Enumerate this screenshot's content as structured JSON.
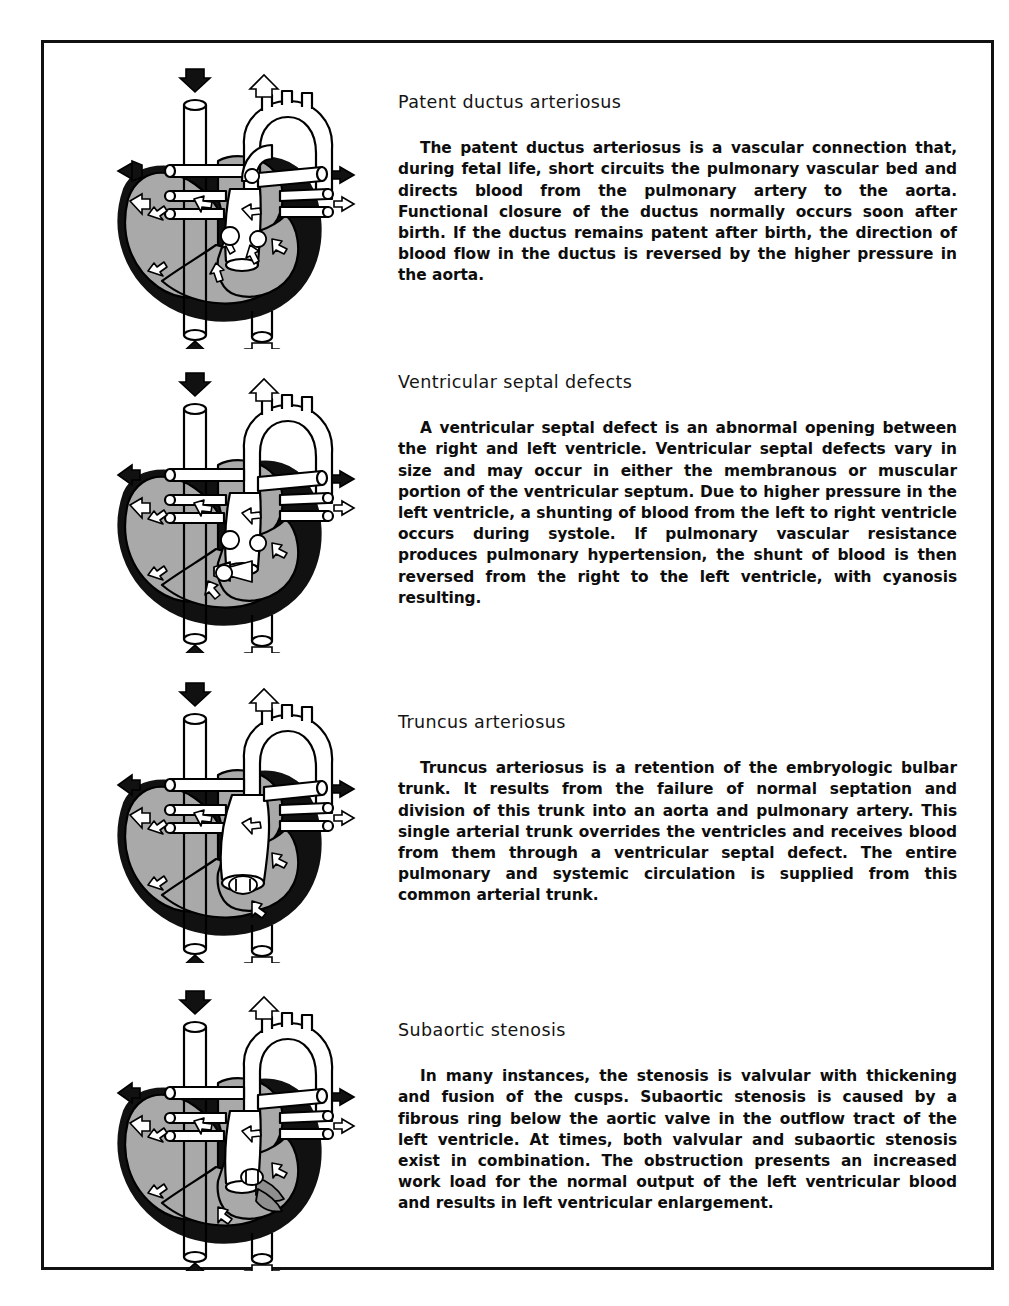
{
  "page": {
    "border_color": "#111111",
    "background": "#ffffff"
  },
  "palette": {
    "outline": "#000000",
    "myocardium_black": "#111111",
    "chamber_gray": "#a9a9a9",
    "vessel_white": "#ffffff",
    "arrow_filled": "#111111",
    "arrow_outline_fill": "#ffffff",
    "stenosis_gray": "#8f8f8f"
  },
  "sections": [
    {
      "id": "patent-ductus-arteriosus",
      "heading": "Patent ductus arteriosus",
      "body": "The patent ductus arteriosus is a vascular connection that, during fetal life, short circuits the pulmonary vascular bed and directs blood from the pulmonary artery to the aorta. Functional closure of the ductus normally occurs soon after birth. If the ductus remains patent after birth, the direction of blood flow in the ductus is reversed by the higher pressure in the aorta.",
      "figure": {
        "name": "heart-diagram-patent-ductus-arteriosus",
        "variant": "pda",
        "flow_arrows": [
          {
            "name": "superior-vena-cava-inflow-arrow",
            "style": "filled",
            "direction": "down"
          },
          {
            "name": "aortic-arch-outflow-arrow",
            "style": "outline",
            "direction": "up"
          },
          {
            "name": "left-systemic-artery-arrow",
            "style": "filled",
            "direction": "left"
          },
          {
            "name": "left-pulmonary-vein-arrow",
            "style": "outline",
            "direction": "left"
          },
          {
            "name": "right-pulmonary-artery-arrow",
            "style": "filled",
            "direction": "right"
          },
          {
            "name": "right-pulmonary-vein-arrow",
            "style": "outline",
            "direction": "right"
          },
          {
            "name": "inferior-vena-cava-inflow-arrow",
            "style": "filled",
            "direction": "up"
          },
          {
            "name": "descending-aorta-outflow-arrow",
            "style": "outline",
            "direction": "down"
          }
        ]
      }
    },
    {
      "id": "ventricular-septal-defects",
      "heading": "Ventricular septal defects",
      "body": "A ventricular septal defect is an abnormal opening between the right and left ventricle. Ventricular septal defects vary in size and may occur in either the membranous or muscular portion of the ventricular septum. Due to higher pressure in the left ventricle, a shunting of blood from the left to right ventricle occurs during systole. If pulmonary vascular resistance produces pulmonary hypertension, the shunt of blood is then reversed from the right to the left ventricle, with cyanosis resulting.",
      "figure": {
        "name": "heart-diagram-ventricular-septal-defect",
        "variant": "vsd",
        "flow_arrows": [
          {
            "name": "superior-vena-cava-inflow-arrow",
            "style": "filled",
            "direction": "down"
          },
          {
            "name": "aortic-arch-outflow-arrow",
            "style": "outline",
            "direction": "up"
          },
          {
            "name": "left-systemic-artery-arrow",
            "style": "filled",
            "direction": "left"
          },
          {
            "name": "left-pulmonary-vein-arrow",
            "style": "outline",
            "direction": "left"
          },
          {
            "name": "right-pulmonary-artery-arrow",
            "style": "filled",
            "direction": "right"
          },
          {
            "name": "right-pulmonary-vein-arrow",
            "style": "outline",
            "direction": "right"
          },
          {
            "name": "inferior-vena-cava-inflow-arrow",
            "style": "filled",
            "direction": "up"
          },
          {
            "name": "descending-aorta-outflow-arrow",
            "style": "outline",
            "direction": "down"
          },
          {
            "name": "septal-shunt-arrow",
            "style": "outline",
            "direction": "left"
          }
        ]
      }
    },
    {
      "id": "truncus-arteriosus",
      "heading": "Truncus arteriosus",
      "body": "Truncus arteriosus is a retention of the embryologic bulbar trunk. It results from the failure of normal septation and division of this trunk into an aorta and pulmonary artery. This single arterial trunk overrides the ventricles and receives blood from them through a ventricular septal defect. The entire pulmonary and systemic circulation is supplied from this common arterial trunk.",
      "figure": {
        "name": "heart-diagram-truncus-arteriosus",
        "variant": "truncus",
        "flow_arrows": [
          {
            "name": "superior-vena-cava-inflow-arrow",
            "style": "filled",
            "direction": "down"
          },
          {
            "name": "common-trunk-outflow-arrow",
            "style": "outline",
            "direction": "up"
          },
          {
            "name": "left-systemic-artery-arrow",
            "style": "filled",
            "direction": "left"
          },
          {
            "name": "left-pulmonary-vein-arrow",
            "style": "outline",
            "direction": "left"
          },
          {
            "name": "right-pulmonary-artery-arrow",
            "style": "filled",
            "direction": "right"
          },
          {
            "name": "right-pulmonary-vein-arrow",
            "style": "outline",
            "direction": "right"
          },
          {
            "name": "inferior-vena-cava-inflow-arrow",
            "style": "filled",
            "direction": "up"
          },
          {
            "name": "descending-aorta-outflow-arrow",
            "style": "outline",
            "direction": "down"
          }
        ]
      }
    },
    {
      "id": "subaortic-stenosis",
      "heading": "Subaortic stenosis",
      "body": "In many instances, the stenosis is valvular with thickening and fusion of the cusps. Subaortic stenosis is caused by a fibrous ring below the aortic valve in the outflow tract of the left ventricle. At times, both valvular and subaortic stenosis exist in combination. The obstruction presents an increased work load for the normal output of the left ventricular blood and results in left ventricular enlargement.",
      "figure": {
        "name": "heart-diagram-subaortic-stenosis",
        "variant": "subaortic",
        "flow_arrows": [
          {
            "name": "superior-vena-cava-inflow-arrow",
            "style": "filled",
            "direction": "down"
          },
          {
            "name": "aortic-arch-outflow-arrow",
            "style": "outline",
            "direction": "up"
          },
          {
            "name": "left-systemic-artery-arrow",
            "style": "filled",
            "direction": "left"
          },
          {
            "name": "left-pulmonary-vein-arrow",
            "style": "outline",
            "direction": "left"
          },
          {
            "name": "right-pulmonary-artery-arrow",
            "style": "filled",
            "direction": "right"
          },
          {
            "name": "right-pulmonary-vein-arrow",
            "style": "outline",
            "direction": "right"
          },
          {
            "name": "inferior-vena-cava-inflow-arrow",
            "style": "filled",
            "direction": "up"
          },
          {
            "name": "descending-aorta-outflow-arrow",
            "style": "outline",
            "direction": "down"
          }
        ]
      }
    }
  ]
}
